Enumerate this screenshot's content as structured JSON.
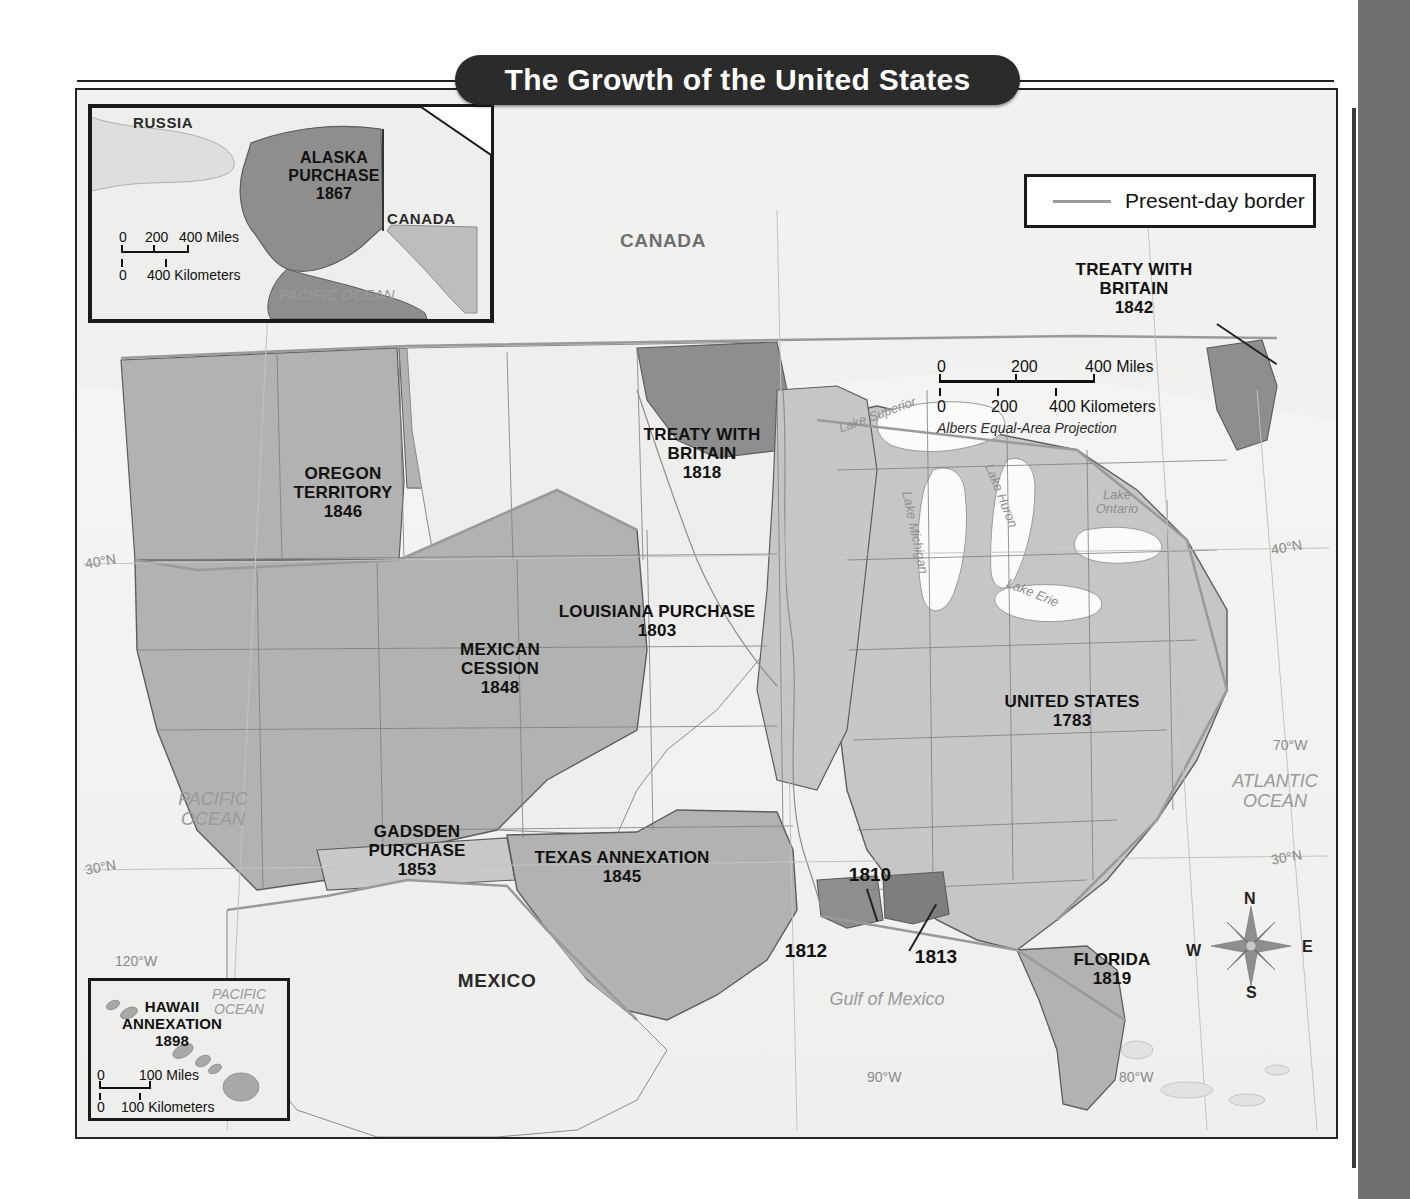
{
  "title": "The Growth of the United States",
  "legend": {
    "swatch_name": "present-day-border-line",
    "label": "Present-day border"
  },
  "main_scale": {
    "miles": {
      "zero": "0",
      "mid": "200",
      "max": "400 Miles"
    },
    "kilometers": {
      "zero": "0",
      "mid": "200",
      "max": "400 Kilometers"
    },
    "projection": "Albers Equal-Area Projection"
  },
  "insets": {
    "alaska": {
      "territory": "ALASKA PURCHASE",
      "label_line1": "ALASKA",
      "label_line2": "PURCHASE",
      "year": "1867",
      "neighbors": [
        "RUSSIA",
        "CANADA"
      ],
      "ocean": "PACIFIC OCEAN",
      "scale": {
        "miles_zero": "0",
        "miles_mid": "200",
        "miles_max": "400 Miles",
        "km_zero": "0",
        "km_max": "400 Kilometers"
      }
    },
    "hawaii": {
      "label_line1": "HAWAII",
      "label_line2": "ANNEXATION",
      "year": "1898",
      "ocean_line1": "PACIFIC",
      "ocean_line2": "OCEAN",
      "scale": {
        "miles_zero": "0",
        "miles_max": "100 Miles",
        "km_zero": "0",
        "km_max": "100 Kilometers"
      }
    }
  },
  "territories": [
    {
      "name": "OREGON TERRITORY",
      "line1": "OREGON",
      "line2": "TERRITORY",
      "year": "1846"
    },
    {
      "name": "MEXICAN CESSION",
      "line1": "MEXICAN",
      "line2": "CESSION",
      "year": "1848"
    },
    {
      "name": "GADSDEN PURCHASE",
      "line1": "GADSDEN",
      "line2": "PURCHASE",
      "year": "1853"
    },
    {
      "name": "TEXAS ANNEXATION",
      "line1": "TEXAS ANNEXATION",
      "line2": "",
      "year": "1845"
    },
    {
      "name": "LOUISIANA PURCHASE",
      "line1": "LOUISIANA PURCHASE",
      "line2": "",
      "year": "1803"
    },
    {
      "name": "TREATY WITH BRITAIN 1818",
      "line1": "TREATY WITH",
      "line2": "BRITAIN",
      "year": "1818"
    },
    {
      "name": "TREATY WITH BRITAIN 1842",
      "line1": "TREATY WITH",
      "line2": "BRITAIN",
      "year": "1842"
    },
    {
      "name": "UNITED STATES",
      "line1": "UNITED STATES",
      "line2": "",
      "year": "1783"
    },
    {
      "name": "FLORIDA",
      "line1": "FLORIDA",
      "line2": "",
      "year": "1819"
    }
  ],
  "year_markers": [
    {
      "name": "west-florida-1810",
      "year": "1810"
    },
    {
      "name": "texas-coast-1812",
      "year": "1812"
    },
    {
      "name": "mobile-1813",
      "year": "1813"
    }
  ],
  "countries": [
    {
      "name": "CANADA"
    },
    {
      "name": "MEXICO"
    }
  ],
  "water_bodies": [
    {
      "name": "PACIFIC OCEAN",
      "line1": "PACIFIC",
      "line2": "OCEAN"
    },
    {
      "name": "ATLANTIC OCEAN",
      "line1": "ATLANTIC",
      "line2": "OCEAN"
    },
    {
      "name": "Gulf of Mexico",
      "line1": "Gulf of Mexico",
      "line2": ""
    }
  ],
  "great_lakes": [
    {
      "name": "Lake Superior"
    },
    {
      "name": "Lake Michigan"
    },
    {
      "name": "Lake Huron"
    },
    {
      "name": "Lake Erie"
    },
    {
      "name": "Lake Ontario",
      "line1": "Lake",
      "line2": "Ontario"
    }
  ],
  "graticule": [
    {
      "name": "lat-40n-west",
      "label": "40°N"
    },
    {
      "name": "lat-30n-west",
      "label": "30°N"
    },
    {
      "name": "lon-120w",
      "label": "120°W"
    },
    {
      "name": "lat-40n-east",
      "label": "40°N"
    },
    {
      "name": "lon-70w",
      "label": "70°W"
    },
    {
      "name": "lat-30n-east",
      "label": "30°N"
    },
    {
      "name": "lon-90w",
      "label": "90°W"
    },
    {
      "name": "lon-80w",
      "label": "80°W"
    }
  ],
  "compass": {
    "n": "N",
    "e": "E",
    "s": "S",
    "w": "W"
  },
  "colors": {
    "acquired_fill": "#b9b9b9",
    "treaty_fill": "#8e8e8e",
    "original_us_fill": "#c6c6c6",
    "unceded_fill": "#eeeeec",
    "border": "#5d5d5d",
    "present_border": "#9a9a9a",
    "banner": "#2b2b2b",
    "panel": "#707070"
  }
}
